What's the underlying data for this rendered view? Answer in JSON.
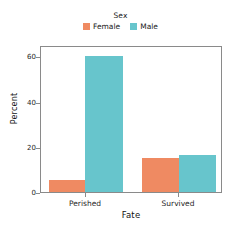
{
  "chart_data": {
    "type": "bar",
    "title": "",
    "subtitle": "",
    "xlabel": "Fate",
    "ylabel": "Percent",
    "categories": [
      "Perished",
      "Survived"
    ],
    "series": [
      {
        "name": "Female",
        "color": "#ef8a62",
        "values": [
          5.4,
          15.4
        ]
      },
      {
        "name": "Male",
        "color": "#67c5cc",
        "values": [
          61.0,
          16.7
        ]
      }
    ],
    "legend": {
      "title": "Sex",
      "position": "top-center",
      "entries": [
        {
          "label": "Female",
          "color": "#ef8a62"
        },
        {
          "label": "Male",
          "color": "#67c5cc"
        }
      ]
    },
    "ylim": [
      0,
      65
    ],
    "yticks": [
      0,
      20,
      40,
      60
    ],
    "ytick_labels": [
      "0",
      "20",
      "40",
      "60"
    ],
    "xtick_labels": [
      "Perished",
      "Survived"
    ],
    "grid": false,
    "frame": true
  },
  "colors": {
    "female": "#ef8a62",
    "male": "#67c5cc",
    "axis": "#8a8a8a",
    "text": "#1a1a1a",
    "background": "#ffffff"
  }
}
